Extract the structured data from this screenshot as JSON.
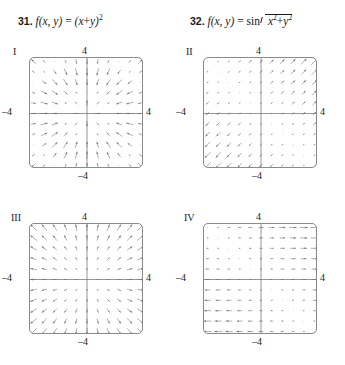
{
  "problems": [
    {
      "number": "31.",
      "func": "f(x, y)",
      "equals": "=",
      "expr_open": "(x",
      "plus": "+",
      "expr_close": "y)",
      "exp": "2",
      "full_text": "31. f(x, y) = (x + y)2"
    },
    {
      "number": "32.",
      "func": "f(x, y)",
      "equals": "=",
      "sin": "sin",
      "rad_x": "x",
      "rad_xexp": "2",
      "rad_plus": "+",
      "rad_y": "y",
      "rad_yexp": "2",
      "full_text": "32. f(x, y) = sin sqrt(x^2 + y^2)"
    }
  ],
  "panels": [
    {
      "id": "I",
      "label": "I",
      "ticks": {
        "top": "4",
        "right": "4",
        "left": "–4",
        "bottom": "–4"
      },
      "axis_min": -4,
      "axis_max": 4
    },
    {
      "id": "II",
      "label": "II",
      "ticks": {
        "top": "4",
        "right": "4",
        "left": "–4",
        "bottom": "–4"
      },
      "axis_min": -4,
      "axis_max": 4
    },
    {
      "id": "III",
      "label": "III",
      "ticks": {
        "top": "4",
        "right": "4",
        "left": "–4",
        "bottom": "–4"
      },
      "axis_min": -4,
      "axis_max": 4
    },
    {
      "id": "IV",
      "label": "IV",
      "ticks": {
        "top": "4",
        "right": "4",
        "left": "–4",
        "bottom": "–4"
      },
      "axis_min": -4,
      "axis_max": 4
    }
  ],
  "colors": {
    "ink": "#1a1a1a",
    "box_border": "#8a8a8a",
    "axis": "#6a6a6a",
    "arrow": "#6e6e6e"
  },
  "chart_data": [
    {
      "type": "scatter",
      "panel": "I",
      "title": "I",
      "field": "sin-radial gradient field",
      "xlabel": "",
      "ylabel": "",
      "xlim": [
        -4,
        4
      ],
      "ylim": [
        -4,
        4
      ],
      "grid": false,
      "legend": "none",
      "gridpoints": 11,
      "formula": "F(x,y) = cos(r)*(x/r, y/r)",
      "description": "Arrows radiate from the origin; outward near the origin, reversing direction in outer annuli; magnitude varies sinusoidally with radius."
    },
    {
      "type": "scatter",
      "panel": "II",
      "title": "II",
      "field": "diagonal gradient field",
      "xlabel": "",
      "ylabel": "",
      "xlim": [
        -4,
        4
      ],
      "ylim": [
        -4,
        4
      ],
      "grid": false,
      "legend": "none",
      "gridpoints": 11,
      "formula": "F(x,y) = 2(x + y)(1, 1)",
      "description": "Every arrow is parallel to the line y = x. Arrows point up-right where x + y > 0 and down-left where x + y < 0; length grows with |x + y| and vanishes on the anti-diagonal."
    },
    {
      "type": "scatter",
      "panel": "III",
      "title": "III",
      "field": "radial outward field",
      "xlabel": "",
      "ylabel": "",
      "xlim": [
        -4,
        4
      ],
      "ylim": [
        -4,
        4
      ],
      "grid": false,
      "legend": "none",
      "gridpoints": 11,
      "formula": "F(x,y) = (x, y)",
      "description": "Arrows point radially away from the origin, growing longer with distance from the origin."
    },
    {
      "type": "scatter",
      "panel": "IV",
      "title": "IV",
      "field": "horizontal gradient field",
      "xlabel": "",
      "ylabel": "",
      "xlim": [
        -4,
        4
      ],
      "ylim": [
        -4,
        4
      ],
      "grid": false,
      "legend": "none",
      "gridpoints": 11,
      "formula": "F(x,y) = (x + y, 0)",
      "description": "All arrows are horizontal; they point right where x + y > 0 and left where x + y < 0, with length proportional to |x + y|."
    }
  ]
}
